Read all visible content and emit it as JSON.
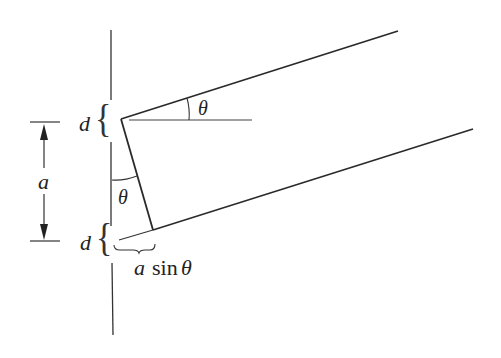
{
  "diagram": {
    "title": "",
    "labels": {
      "d_top": "d",
      "d_bottom": "d",
      "a_dimension": "a",
      "theta_top": "θ",
      "theta_left": "θ",
      "a_sin_a": "a",
      "a_sin_sin": "sin",
      "a_sin_theta": "θ",
      "brace_top": "{",
      "brace_bottom": "{"
    },
    "colors": {
      "stroke": "#2a2a2a",
      "thin": "#444444",
      "background": "#ffffff"
    }
  }
}
